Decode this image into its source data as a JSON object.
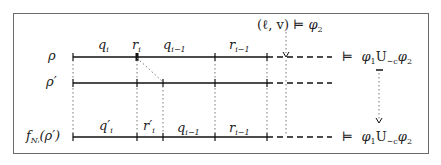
{
  "diagram": {
    "rows": [
      {
        "id": "rho",
        "label": "ρ",
        "y": 57
      },
      {
        "id": "rho-prime",
        "label": "ρ′",
        "y": 83
      },
      {
        "id": "f-rho-prime",
        "label_main": "f",
        "label_sub": "Nᵢ",
        "label_tail": "(ρ′)",
        "y": 137
      }
    ],
    "top_segments": {
      "q_i": "q",
      "q_i_sub": "i",
      "r_i": "r",
      "r_i_sub": "i",
      "q_im1": "q",
      "q_im1_sub": "i−1",
      "r_im1": "r",
      "r_im1_sub": "i−1"
    },
    "bottom_segments": {
      "q_i_prime": "q′",
      "q_i_prime_sub": "i",
      "r_i_prime": "r′",
      "r_i_prime_sub": "i",
      "q_im1": "q",
      "q_im1_sub": "i−1",
      "r_im1": "r",
      "r_im1_sub": "i−1"
    },
    "annotation_top": {
      "text": "(ℓ, v)",
      "models": "⊨",
      "phi": "φ",
      "phi_sub": "2"
    },
    "result_top": {
      "models": "⊨",
      "phi1": "φ",
      "phi1_sub": "1",
      "until": "U",
      "until_sub": "∼c",
      "phi2": "φ",
      "phi2_sub": "2"
    },
    "result_bottom": {
      "models": "⊨",
      "phi1": "φ",
      "phi1_sub": "1",
      "until": "U",
      "until_sub": "∼c",
      "phi2": "φ",
      "phi2_sub": "2"
    },
    "colors": {
      "line": "#111111",
      "frame": "#6a6a6a",
      "dotted": "#777777"
    }
  }
}
